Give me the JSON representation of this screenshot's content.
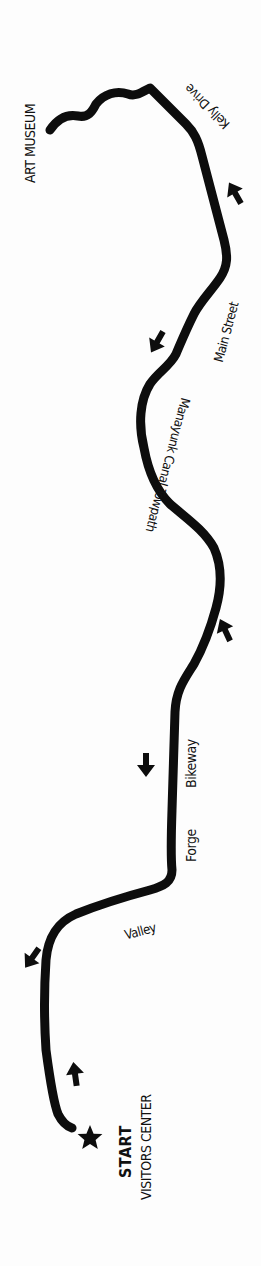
{
  "map": {
    "title": "Valley Forge to Art Museum bike route",
    "colors": {
      "route": "#0d0d0d",
      "background": "#fdfdfd",
      "text": "#111111"
    },
    "endpoints": {
      "start": {
        "label": "START",
        "sublabel": "VISITORS CENTER",
        "icon": "star-icon"
      },
      "end": {
        "label": "ART MUSEUM"
      }
    },
    "route_segments": [
      {
        "name": "Valley",
        "part_of": "Valley Forge Bikeway"
      },
      {
        "name": "Forge",
        "part_of": "Valley Forge Bikeway"
      },
      {
        "name": "Bikeway",
        "part_of": "Valley Forge Bikeway"
      },
      {
        "name": "Manayunk Canal Towpath"
      },
      {
        "name": "Main Street"
      },
      {
        "name": "Kelly Drive"
      }
    ],
    "labels": {
      "valley": "Valley",
      "forge": "Forge",
      "bikeway": "Bikeway",
      "towpath": "Manayunk Canal Towpath",
      "main_street": "Main Street",
      "kelly_drive": "Kelly Drive",
      "art_museum": "ART MUSEUM",
      "start": "START",
      "visitors_center": "VISITORS CENTER"
    },
    "direction_arrows": [
      {
        "id": "arrow-kelly",
        "direction": "up-left"
      },
      {
        "id": "arrow-main",
        "direction": "down-left"
      },
      {
        "id": "arrow-towpath",
        "direction": "up-left"
      },
      {
        "id": "arrow-bikeway",
        "direction": "down"
      },
      {
        "id": "arrow-valley",
        "direction": "down-left"
      },
      {
        "id": "arrow-start",
        "direction": "up"
      }
    ]
  }
}
